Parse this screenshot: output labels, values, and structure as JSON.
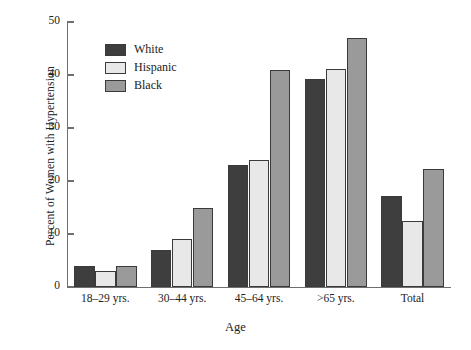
{
  "chart_data": {
    "type": "bar",
    "title": "",
    "xlabel": "Age",
    "ylabel": "Percent of Women with Hypertension",
    "categories": [
      "18–29 yrs.",
      "30–44 yrs.",
      "45–64 yrs.",
      ">65 yrs.",
      "Total"
    ],
    "series": [
      {
        "name": "White",
        "color": "#3e3e3e",
        "values": [
          4,
          7,
          23,
          39.2,
          17.2
        ]
      },
      {
        "name": "Hispanic",
        "color": "#e8e8e8",
        "values": [
          3,
          9,
          24,
          41.2,
          12.4
        ]
      },
      {
        "name": "Black",
        "color": "#9a9a9a",
        "values": [
          4,
          15,
          41,
          47,
          22.3
        ]
      }
    ],
    "ylim": [
      0,
      50
    ],
    "yticks": [
      0,
      10,
      20,
      30,
      40,
      50
    ],
    "ytick_labels": [
      "0",
      "10",
      "20",
      "30",
      "40",
      "50"
    ],
    "grid": false,
    "legend_position": "upper-left-inside"
  },
  "legend": {
    "items": [
      {
        "label": "White"
      },
      {
        "label": "Hispanic"
      },
      {
        "label": "Black"
      }
    ]
  },
  "axes": {
    "y_title": "Percent of Women with Hypertension",
    "x_title": "Age"
  }
}
